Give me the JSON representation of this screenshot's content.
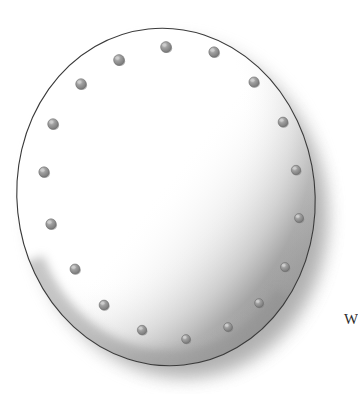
{
  "figure": {
    "background_color": "#ffffff",
    "render_style": "grayscale-shaded-line-drawing",
    "caption_fragment": "W",
    "caption_fragment_position": {
      "x": 344,
      "y": 312
    },
    "disc": {
      "center_x": 166,
      "center_y": 197,
      "radius_x": 149,
      "radius_y": 169,
      "rotation_deg": -6,
      "face_color": "#ffffff",
      "outline_color": "#3a3a3a",
      "outline_width": 1.1,
      "shadow_color": "#6e6e6e",
      "shadow_side": "bottom-right",
      "highlight_side": "top-left"
    },
    "fasteners": {
      "count": 18,
      "label": "ring of fastener studs",
      "fill_color": "#8f8f8f",
      "edge_color": "#6a6a6a",
      "highlight_color": "#d0d0d0",
      "ring_radius_x": 128,
      "ring_radius_y": 146,
      "radius_px": 5.1,
      "angles_deg": [
        270,
        290,
        310,
        330,
        350,
        10,
        30,
        50,
        70,
        90,
        110,
        130,
        150,
        170,
        190,
        210,
        230,
        250
      ],
      "positions": [
        {
          "id": "stud-01",
          "x": 166,
          "y": 47,
          "r": 5.4
        },
        {
          "id": "stud-02",
          "x": 214,
          "y": 52,
          "r": 5.2
        },
        {
          "id": "stud-03",
          "x": 254,
          "y": 82,
          "r": 5.1
        },
        {
          "id": "stud-04",
          "x": 283,
          "y": 122,
          "r": 4.9
        },
        {
          "id": "stud-05",
          "x": 296,
          "y": 170,
          "r": 4.7
        },
        {
          "id": "stud-06",
          "x": 299,
          "y": 218,
          "r": 4.5
        },
        {
          "id": "stud-07",
          "x": 285,
          "y": 267,
          "r": 4.5
        },
        {
          "id": "stud-08",
          "x": 259,
          "y": 303,
          "r": 4.4
        },
        {
          "id": "stud-09",
          "x": 228,
          "y": 327,
          "r": 4.4
        },
        {
          "id": "stud-10",
          "x": 186,
          "y": 339,
          "r": 4.4
        },
        {
          "id": "stud-11",
          "x": 142,
          "y": 330,
          "r": 4.7
        },
        {
          "id": "stud-12",
          "x": 104,
          "y": 305,
          "r": 4.9
        },
        {
          "id": "stud-13",
          "x": 75,
          "y": 269,
          "r": 5.0
        },
        {
          "id": "stud-14",
          "x": 51,
          "y": 224,
          "r": 5.2
        },
        {
          "id": "stud-15",
          "x": 44,
          "y": 172,
          "r": 5.2
        },
        {
          "id": "stud-16",
          "x": 53,
          "y": 124,
          "r": 5.3
        },
        {
          "id": "stud-17",
          "x": 81,
          "y": 84,
          "r": 5.3
        },
        {
          "id": "stud-18",
          "x": 119,
          "y": 60,
          "r": 5.4
        }
      ]
    }
  }
}
